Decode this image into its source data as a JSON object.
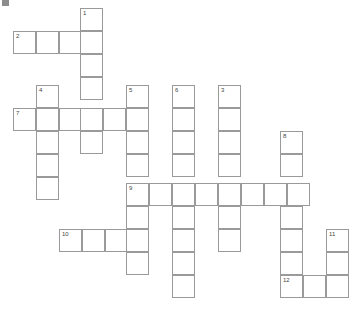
{
  "puzzle": {
    "title": "",
    "cell_size": 23,
    "grid_origin": {
      "x": 13,
      "y": 8
    },
    "corner_mark": "corner-mark",
    "columns_px": [
      13,
      36,
      59,
      80,
      126,
      172,
      218,
      280,
      326
    ],
    "rows_px": [
      8,
      31,
      54,
      85,
      108,
      131,
      160,
      183,
      206,
      229,
      252,
      275
    ],
    "clue_numbers": [
      "1",
      "2",
      "3",
      "4",
      "5",
      "6",
      "7",
      "8",
      "9",
      "10",
      "11",
      "12"
    ],
    "colors": {
      "grid_line": "#9a9a9a",
      "cell_fill": "#ffffff",
      "number_text": "#444444",
      "page_background": "#ffffff"
    },
    "cells": [
      {
        "x": 80,
        "y": 8,
        "num": "1",
        "letter": ""
      },
      {
        "x": 13,
        "y": 31,
        "num": "2",
        "letter": ""
      },
      {
        "x": 36,
        "y": 31,
        "num": "",
        "letter": ""
      },
      {
        "x": 59,
        "y": 31,
        "num": "",
        "letter": ""
      },
      {
        "x": 80,
        "y": 31,
        "num": "",
        "letter": ""
      },
      {
        "x": 80,
        "y": 54,
        "num": "",
        "letter": ""
      },
      {
        "x": 80,
        "y": 77,
        "num": "",
        "letter": ""
      },
      {
        "x": 36,
        "y": 85,
        "num": "4",
        "letter": ""
      },
      {
        "x": 126,
        "y": 85,
        "num": "5",
        "letter": ""
      },
      {
        "x": 172,
        "y": 85,
        "num": "6",
        "letter": ""
      },
      {
        "x": 218,
        "y": 85,
        "num": "3",
        "letter": ""
      },
      {
        "x": 13,
        "y": 108,
        "num": "7",
        "letter": ""
      },
      {
        "x": 36,
        "y": 108,
        "num": "",
        "letter": ""
      },
      {
        "x": 59,
        "y": 108,
        "num": "",
        "letter": ""
      },
      {
        "x": 80,
        "y": 108,
        "num": "",
        "letter": ""
      },
      {
        "x": 103,
        "y": 108,
        "num": "",
        "letter": ""
      },
      {
        "x": 126,
        "y": 108,
        "num": "",
        "letter": ""
      },
      {
        "x": 172,
        "y": 108,
        "num": "",
        "letter": ""
      },
      {
        "x": 218,
        "y": 108,
        "num": "",
        "letter": ""
      },
      {
        "x": 36,
        "y": 131,
        "num": "",
        "letter": ""
      },
      {
        "x": 80,
        "y": 131,
        "num": "",
        "letter": ""
      },
      {
        "x": 126,
        "y": 131,
        "num": "",
        "letter": ""
      },
      {
        "x": 172,
        "y": 131,
        "num": "",
        "letter": ""
      },
      {
        "x": 218,
        "y": 131,
        "num": "",
        "letter": ""
      },
      {
        "x": 280,
        "y": 131,
        "num": "8",
        "letter": ""
      },
      {
        "x": 36,
        "y": 154,
        "num": "",
        "letter": ""
      },
      {
        "x": 126,
        "y": 154,
        "num": "",
        "letter": ""
      },
      {
        "x": 172,
        "y": 154,
        "num": "",
        "letter": ""
      },
      {
        "x": 218,
        "y": 154,
        "num": "",
        "letter": ""
      },
      {
        "x": 280,
        "y": 154,
        "num": "",
        "letter": ""
      },
      {
        "x": 36,
        "y": 177,
        "num": "",
        "letter": ""
      },
      {
        "x": 126,
        "y": 183,
        "num": "9",
        "letter": ""
      },
      {
        "x": 149,
        "y": 183,
        "num": "",
        "letter": ""
      },
      {
        "x": 172,
        "y": 183,
        "num": "",
        "letter": ""
      },
      {
        "x": 195,
        "y": 183,
        "num": "",
        "letter": ""
      },
      {
        "x": 218,
        "y": 183,
        "num": "",
        "letter": ""
      },
      {
        "x": 241,
        "y": 183,
        "num": "",
        "letter": ""
      },
      {
        "x": 264,
        "y": 183,
        "num": "",
        "letter": ""
      },
      {
        "x": 287,
        "y": 183,
        "num": "",
        "letter": ""
      },
      {
        "x": 126,
        "y": 206,
        "num": "",
        "letter": ""
      },
      {
        "x": 172,
        "y": 206,
        "num": "",
        "letter": ""
      },
      {
        "x": 218,
        "y": 206,
        "num": "",
        "letter": ""
      },
      {
        "x": 280,
        "y": 206,
        "num": "",
        "letter": ""
      },
      {
        "x": 59,
        "y": 229,
        "num": "10",
        "letter": ""
      },
      {
        "x": 82,
        "y": 229,
        "num": "",
        "letter": ""
      },
      {
        "x": 105,
        "y": 229,
        "num": "",
        "letter": ""
      },
      {
        "x": 126,
        "y": 229,
        "num": "",
        "letter": ""
      },
      {
        "x": 172,
        "y": 229,
        "num": "",
        "letter": ""
      },
      {
        "x": 218,
        "y": 229,
        "num": "",
        "letter": ""
      },
      {
        "x": 280,
        "y": 229,
        "num": "",
        "letter": ""
      },
      {
        "x": 326,
        "y": 229,
        "num": "11",
        "letter": ""
      },
      {
        "x": 126,
        "y": 252,
        "num": "",
        "letter": ""
      },
      {
        "x": 172,
        "y": 252,
        "num": "",
        "letter": ""
      },
      {
        "x": 280,
        "y": 252,
        "num": "",
        "letter": ""
      },
      {
        "x": 326,
        "y": 252,
        "num": "",
        "letter": ""
      },
      {
        "x": 172,
        "y": 275,
        "num": "",
        "letter": ""
      },
      {
        "x": 280,
        "y": 275,
        "num": "12",
        "letter": ""
      },
      {
        "x": 303,
        "y": 275,
        "num": "",
        "letter": ""
      },
      {
        "x": 326,
        "y": 275,
        "num": "",
        "letter": ""
      }
    ]
  }
}
